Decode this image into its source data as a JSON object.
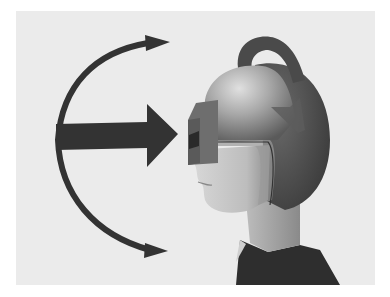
{
  "figure": {
    "colors": {
      "page_background": "#ffffff",
      "panel_background": "#ebebeb",
      "arrow": "#333333",
      "helmet_light": "#b8b8b8",
      "helmet_dark": "#4a4a4a",
      "visor": "#6e6e6e",
      "skin": "#cfcfcf",
      "shirt": "#2e2e2e"
    }
  }
}
